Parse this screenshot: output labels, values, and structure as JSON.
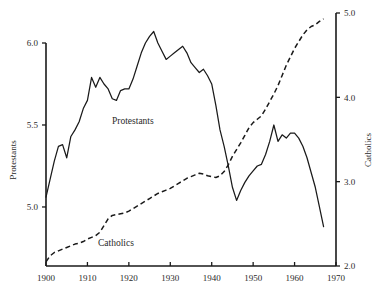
{
  "chart_data": {
    "type": "line",
    "title": "",
    "subtitle": "",
    "xlabel": "",
    "grid": false,
    "legend_position": "inline-annotation",
    "x": [
      1900,
      1901,
      1902,
      1903,
      1904,
      1905,
      1906,
      1907,
      1908,
      1909,
      1910,
      1911,
      1912,
      1913,
      1914,
      1915,
      1916,
      1917,
      1918,
      1919,
      1920,
      1921,
      1922,
      1923,
      1924,
      1925,
      1926,
      1927,
      1928,
      1929,
      1930,
      1931,
      1932,
      1933,
      1934,
      1935,
      1936,
      1937,
      1938,
      1939,
      1940,
      1941,
      1942,
      1943,
      1944,
      1945,
      1946,
      1947,
      1948,
      1949,
      1950,
      1951,
      1952,
      1953,
      1954,
      1955,
      1956,
      1957,
      1958,
      1959,
      1960,
      1961,
      1962,
      1963,
      1964,
      1965,
      1966,
      1967
    ],
    "xlim": [
      1900,
      1970
    ],
    "xticks": [
      1900,
      1910,
      1920,
      1930,
      1940,
      1950,
      1960,
      1970
    ],
    "xticklabels": [
      "1900",
      "1910",
      "1920",
      "1930",
      "1940",
      "1950",
      "1960",
      "1970"
    ],
    "axes": [
      {
        "id": "left",
        "label": "Protestants",
        "ylim": [
          4.64,
          6.0
        ],
        "yticks": [
          5.0,
          5.5,
          6.0
        ],
        "yticklabels": [
          "5.0",
          "5.5",
          "6.0"
        ]
      },
      {
        "id": "right",
        "label": "Catholics",
        "ylim": [
          2.0,
          5.0
        ],
        "yticks": [
          2.0,
          3.0,
          4.0,
          5.0
        ],
        "yticklabels": [
          "2.0",
          "3.0",
          "4.0",
          "5.0"
        ]
      }
    ],
    "series": [
      {
        "name": "Protestants",
        "axis": "left",
        "style": "solid",
        "annotation": "Protestants",
        "values": [
          5.06,
          5.17,
          5.28,
          5.37,
          5.38,
          5.3,
          5.43,
          5.47,
          5.52,
          5.6,
          5.65,
          5.79,
          5.73,
          5.79,
          5.75,
          5.72,
          5.66,
          5.65,
          5.71,
          5.72,
          5.72,
          5.78,
          5.86,
          5.94,
          6.0,
          6.04,
          6.07,
          6.0,
          5.95,
          5.9,
          5.92,
          5.94,
          5.96,
          5.98,
          5.94,
          5.88,
          5.85,
          5.82,
          5.84,
          5.8,
          5.75,
          5.62,
          5.47,
          5.37,
          5.25,
          5.12,
          5.04,
          5.1,
          5.15,
          5.19,
          5.22,
          5.25,
          5.26,
          5.32,
          5.4,
          5.5,
          5.4,
          5.44,
          5.42,
          5.45,
          5.45,
          5.42,
          5.37,
          5.3,
          5.21,
          5.12,
          5.0,
          4.88
        ]
      },
      {
        "name": "Catholics",
        "axis": "right",
        "style": "dashed",
        "annotation": "Catholics",
        "values": [
          2.05,
          2.12,
          2.16,
          2.18,
          2.2,
          2.22,
          2.24,
          2.26,
          2.27,
          2.29,
          2.32,
          2.34,
          2.36,
          2.4,
          2.48,
          2.56,
          2.6,
          2.61,
          2.62,
          2.63,
          2.65,
          2.68,
          2.71,
          2.74,
          2.77,
          2.8,
          2.83,
          2.86,
          2.88,
          2.9,
          2.92,
          2.95,
          2.98,
          3.01,
          3.04,
          3.06,
          3.08,
          3.1,
          3.09,
          3.07,
          3.06,
          3.05,
          3.07,
          3.12,
          3.2,
          3.3,
          3.38,
          3.46,
          3.55,
          3.64,
          3.7,
          3.74,
          3.78,
          3.86,
          3.95,
          4.04,
          4.14,
          4.26,
          4.38,
          4.48,
          4.58,
          4.66,
          4.74,
          4.8,
          4.84,
          4.86,
          4.9,
          4.93
        ]
      }
    ]
  },
  "left_axis": {
    "title": "Protestants",
    "ticks": [
      "6.0",
      "5.5",
      "5.0"
    ]
  },
  "right_axis": {
    "title": "Catholics",
    "ticks": [
      "5.0",
      "4.0",
      "3.0",
      "2.0"
    ]
  },
  "x_axis": {
    "ticks": [
      "1900",
      "1910",
      "1920",
      "1930",
      "1940",
      "1950",
      "1960",
      "1970"
    ]
  },
  "annotations": {
    "protestants": "Protestants",
    "catholics": "Catholics"
  },
  "colors": {
    "ink": "#1a1a1a",
    "background": "#ffffff"
  }
}
